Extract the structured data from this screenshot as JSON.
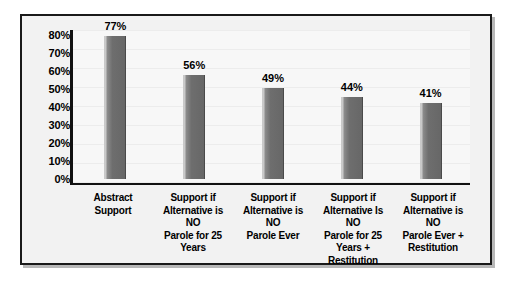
{
  "chart_data": {
    "type": "bar",
    "title": "",
    "subtitle": "",
    "xlabel": "",
    "ylabel": "",
    "ylim": [
      0,
      80
    ],
    "grid": true,
    "legend": false,
    "categories": [
      "Abstract\nSupport",
      "Support if\nAlternative is NO\nParole for 25 Years",
      "Support if\nAlternative is NO\nParole Ever",
      "Support if\nAlternative Is NO\nParole for 25\nYears +\nRestitution",
      "Support if\nAlternative is NO\nParole Ever +\nRestitution"
    ],
    "values": [
      77,
      56,
      49,
      44,
      41
    ],
    "value_labels": [
      "77%",
      "56%",
      "49%",
      "44%",
      "41%"
    ],
    "ytick_labels": [
      "80%",
      "70%",
      "60%",
      "50%",
      "40%",
      "30%",
      "20%",
      "10%",
      "0%"
    ],
    "ytick_values": [
      80,
      70,
      60,
      50,
      40,
      30,
      20,
      10,
      0
    ],
    "colors": {
      "bar": "#6e6e6e",
      "bar_highlight": "#c9c9c9",
      "axis": "#111111",
      "frame_border": "#1a1a1a",
      "plot_background": "#f7f7f7",
      "chart_background": "#f2f2f2",
      "text": "#000000",
      "gridline": "#ececec"
    },
    "categories_lines": [
      [
        "Abstract",
        "Support"
      ],
      [
        "Support if",
        "Alternative is NO",
        "Parole for 25 Years"
      ],
      [
        "Support if",
        "Alternative is NO",
        "Parole Ever"
      ],
      [
        "Support if",
        "Alternative Is NO",
        "Parole for 25",
        "Years +",
        "Restitution"
      ],
      [
        "Support if",
        "Alternative is NO",
        "Parole Ever +",
        "Restitution"
      ]
    ]
  }
}
